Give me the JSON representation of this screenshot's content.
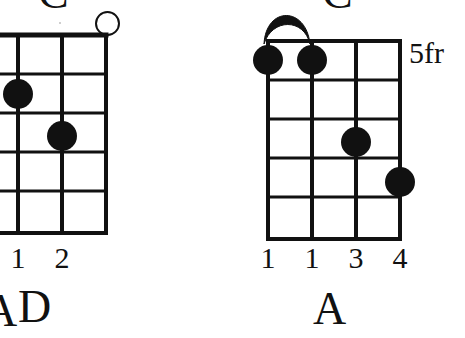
{
  "page": {
    "width": 465,
    "height": 338,
    "background": "#ffffff",
    "ink_color": "#111111",
    "content_type": "guitar-chord-diagram-chart",
    "note": "Two cropped chord boxes side by side on white paper"
  },
  "chords": [
    {
      "id": "left",
      "name_top": "C",
      "name_bottom": "D",
      "partial_name_bottom_left": "A",
      "strings": 4,
      "frets": 5,
      "nut": false,
      "position_label": "",
      "cropped_left": true,
      "open_strings": [
        4
      ],
      "muted_strings": [],
      "barre": null,
      "dots": [
        {
          "string": 2,
          "fret": 2,
          "finger": "1"
        },
        {
          "string": 3,
          "fret": 3,
          "finger": "2"
        }
      ],
      "finger_numbers": [
        {
          "string": 2,
          "label": "1"
        },
        {
          "string": 3,
          "label": "2"
        }
      ]
    },
    {
      "id": "right",
      "name_top": "C",
      "name_bottom": "A",
      "strings": 4,
      "frets": 5,
      "nut": false,
      "position_label": "5fr",
      "cropped_left": false,
      "open_strings": [],
      "muted_strings": [],
      "barre": {
        "fret": 1,
        "from_string": 1,
        "to_string": 2,
        "finger": "1"
      },
      "dots": [
        {
          "string": 1,
          "fret": 1,
          "finger": "1"
        },
        {
          "string": 2,
          "fret": 1,
          "finger": "1"
        },
        {
          "string": 3,
          "fret": 3,
          "finger": "3"
        },
        {
          "string": 4,
          "fret": 4,
          "finger": "4"
        }
      ],
      "finger_numbers": [
        {
          "string": 1,
          "label": "1"
        },
        {
          "string": 2,
          "label": "1"
        },
        {
          "string": 3,
          "label": "3"
        },
        {
          "string": 4,
          "label": "4"
        }
      ]
    }
  ],
  "labels": {
    "left_top_name": "C",
    "left_bottom_name": "D",
    "left_bottom_partial": "A",
    "left_finger_1": "1",
    "left_finger_2": "2",
    "right_top_name": "C",
    "right_bottom_name": "A",
    "right_fret_position": "5fr",
    "right_finger_1": "1",
    "right_finger_2": "1",
    "right_finger_3": "3",
    "right_finger_4": "4"
  }
}
